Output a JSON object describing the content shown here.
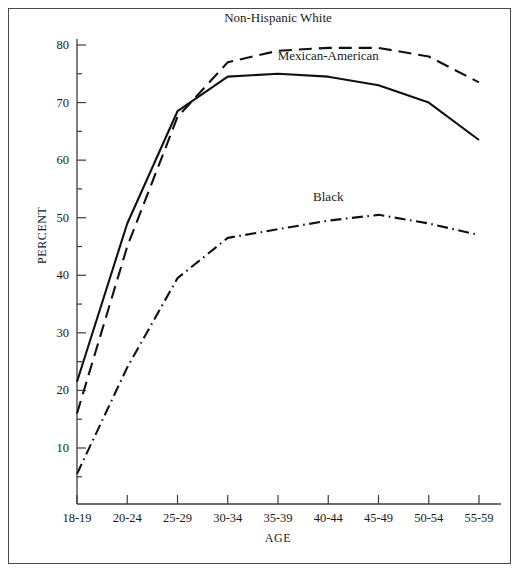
{
  "chart_data": {
    "type": "line",
    "title": "",
    "xlabel": "AGE",
    "ylabel": "PERCENT",
    "categories": [
      "18-19",
      "20-24",
      "25-29",
      "30-34",
      "35-39",
      "40-44",
      "45-49",
      "50-54",
      "55-59"
    ],
    "ylim": [
      0,
      80
    ],
    "y_major_ticks": [
      10,
      20,
      30,
      40,
      50,
      60,
      70,
      80
    ],
    "y_tick_labels": [
      "10",
      "20",
      "30",
      "40",
      "50",
      "60",
      "70",
      "80"
    ],
    "y_minor_tick_interval": 5,
    "grid": false,
    "legend_position": "inline-annotations",
    "series": [
      {
        "name": "Non-Hispanic White",
        "line_style": "dashed",
        "color": "#111111",
        "values": [
          16.0,
          45.0,
          67.5,
          77.0,
          79.0,
          79.5,
          79.5,
          78.0,
          73.5
        ],
        "label_x_category": "35-39",
        "label_value": 84.5
      },
      {
        "name": "Mexican-American",
        "line_style": "solid",
        "color": "#111111",
        "values": [
          21.5,
          49.0,
          68.5,
          74.5,
          75.0,
          74.5,
          73.0,
          70.0,
          63.5
        ],
        "label_x_category": "40-44",
        "label_value": 78.0
      },
      {
        "name": "Black",
        "line_style": "dash-dot",
        "color": "#111111",
        "values": [
          5.5,
          24.0,
          39.5,
          46.5,
          48.0,
          49.5,
          50.5,
          49.0,
          47.0
        ],
        "label_x_category": "40-44",
        "label_value": 53.5
      }
    ]
  },
  "annotations": {
    "non_hispanic_white": "Non-Hispanic White",
    "mexican_american": "Mexican-American",
    "black": "Black"
  },
  "axes": {
    "x_title": "AGE",
    "y_title": "PERCENT"
  }
}
